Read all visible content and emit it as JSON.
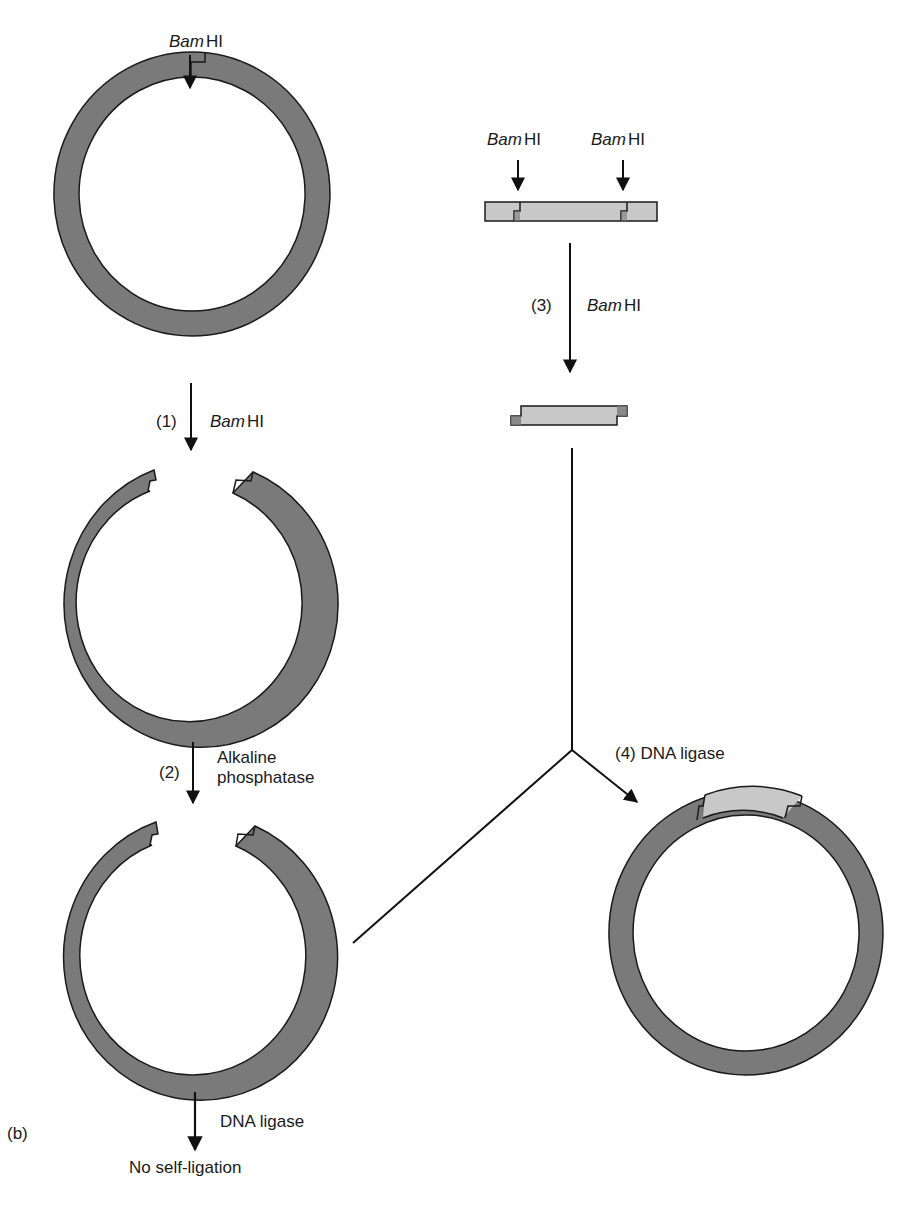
{
  "figure": {
    "panel_label": "(b)",
    "colors": {
      "vector_fill": "#7a7a7a",
      "insert_fill": "#c8c8c8",
      "outline": "#1a1a1a",
      "background": "#ffffff"
    }
  },
  "vector_plasmid": {
    "site_label": {
      "enzyme_italic": "Bam",
      "enzyme_roman": "HI"
    }
  },
  "step1": {
    "number": "(1)",
    "enzyme_italic": "Bam",
    "enzyme_roman": "HI"
  },
  "step2": {
    "number": "(2)",
    "line1": "Alkaline",
    "line2": "phosphatase"
  },
  "self_ligation": {
    "reagent": "DNA ligase",
    "result": "No self-ligation"
  },
  "insert_dna": {
    "site_labels": [
      {
        "enzyme_italic": "Bam",
        "enzyme_roman": "HI"
      },
      {
        "enzyme_italic": "Bam",
        "enzyme_roman": "HI"
      }
    ]
  },
  "step3": {
    "number": "(3)",
    "enzyme_italic": "Bam",
    "enzyme_roman": "HI"
  },
  "step4": {
    "label": "(4) DNA ligase"
  }
}
